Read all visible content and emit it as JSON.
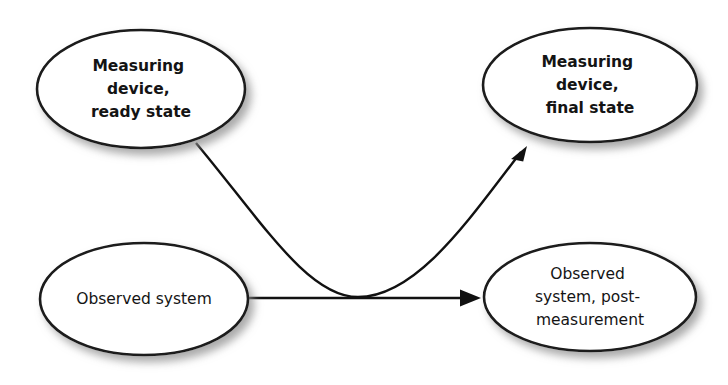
{
  "diagram": {
    "type": "flow-diagram",
    "background_color": "#ffffff",
    "stroke_color": "#1a1a1a",
    "text_color": "#141414",
    "shadow_color": "#9a9a9a",
    "nodes": [
      {
        "id": "measuring-device-ready",
        "shape": "ellipse",
        "bold": true,
        "lines": [
          "Measuring",
          "device,",
          "ready state"
        ],
        "text": "Measuring device, ready state",
        "cx": 141,
        "cy": 89,
        "rx": 104,
        "ry": 59
      },
      {
        "id": "measuring-device-final",
        "shape": "ellipse",
        "bold": true,
        "lines": [
          "Measuring",
          "device,",
          "final state"
        ],
        "text": "Measuring device, final state",
        "cx": 590,
        "cy": 85,
        "rx": 107,
        "ry": 57
      },
      {
        "id": "observed-system",
        "shape": "ellipse",
        "bold": false,
        "lines": [
          "Observed system"
        ],
        "text": "Observed system",
        "cx": 144,
        "cy": 299,
        "rx": 104,
        "ry": 56
      },
      {
        "id": "observed-system-post",
        "shape": "ellipse",
        "bold": false,
        "lines": [
          "Observed",
          "system, post-",
          "measurement"
        ],
        "text": "Observed system, post-measurement",
        "cx": 590,
        "cy": 297,
        "rx": 106,
        "ry": 54
      }
    ],
    "edges": [
      {
        "id": "edge-device-to-final",
        "from": "measuring-device-ready",
        "to": "measuring-device-final",
        "style": "curved",
        "arrowhead": "filled-triangle",
        "path": "M 196 143 C 262 222, 308 297, 358 297 C 418 297, 472 215, 521 152",
        "tip": {
          "x": 527,
          "y": 146
        },
        "angle_deg": -52
      },
      {
        "id": "edge-system-to-post",
        "from": "observed-system",
        "to": "observed-system-post",
        "style": "straight",
        "arrowhead": "filled-triangle",
        "path": "M 247 298 L 463 298",
        "tip": {
          "x": 481,
          "y": 298
        },
        "angle_deg": 0
      }
    ]
  }
}
